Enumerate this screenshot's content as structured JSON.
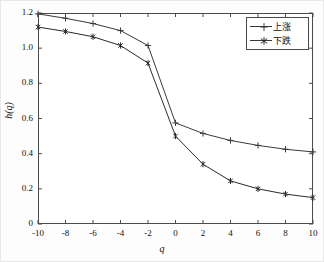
{
  "chart_data": {
    "type": "line",
    "title": "",
    "xlabel": "q",
    "ylabel": "h(q)",
    "xlim": [
      -10,
      10
    ],
    "ylim": [
      0,
      1.2
    ],
    "grid": false,
    "legend_position": "top-right-inside",
    "x": [
      -10,
      -8,
      -6,
      -4,
      -2,
      0,
      2,
      4,
      6,
      8,
      10
    ],
    "xticks": [
      "-10",
      "-8",
      "-6",
      "-4",
      "-2",
      "0",
      "2",
      "4",
      "6",
      "8",
      "10"
    ],
    "yticks": [
      "0",
      "0.2",
      "0.4",
      "0.6",
      "0.8",
      "1.0",
      "1.2"
    ],
    "ytick_values": [
      0,
      0.2,
      0.4,
      0.6,
      0.8,
      1.0,
      1.2
    ],
    "series": [
      {
        "name": "上涨",
        "marker": "plus",
        "color": "#3a3a3a",
        "values": [
          1.195,
          1.17,
          1.14,
          1.1,
          1.015,
          0.575,
          0.515,
          0.475,
          0.447,
          0.425,
          0.41
        ]
      },
      {
        "name": "下跌",
        "marker": "asterisk",
        "color": "#2a2a2a",
        "values": [
          1.12,
          1.095,
          1.065,
          1.015,
          0.915,
          0.5,
          0.34,
          0.245,
          0.2,
          0.17,
          0.15
        ]
      }
    ]
  },
  "axes": {
    "xlabel": "q",
    "ylabel": "h(q)"
  },
  "legend": {
    "items": [
      {
        "label": "上涨"
      },
      {
        "label": "下跌"
      }
    ]
  }
}
